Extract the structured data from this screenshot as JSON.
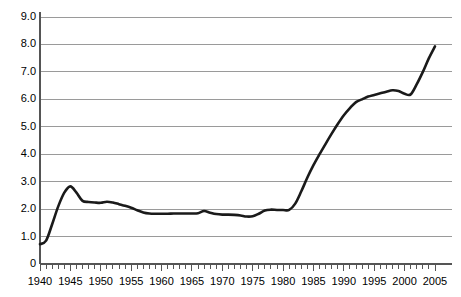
{
  "chart_data": {
    "type": "line",
    "title": "",
    "subtitle": "",
    "xlabel": "",
    "ylabel": "",
    "xlim": [
      1940,
      2005
    ],
    "ylim": [
      0,
      9.0
    ],
    "grid": true,
    "grid_axis": "y",
    "legend": false,
    "legend_position": "none",
    "line_color": "#1a1a1a",
    "line_width": 2.6,
    "grid_color": "#9a9a9a",
    "axis_color": "#555555",
    "background": "#ffffff",
    "x_tick_labels": [
      "1940",
      "1945",
      "1950",
      "1955",
      "1960",
      "1965",
      "1970",
      "1975",
      "1980",
      "1985",
      "1990",
      "1995",
      "2000",
      "2005"
    ],
    "x_tick_values": [
      1940,
      1945,
      1950,
      1955,
      1960,
      1965,
      1970,
      1975,
      1980,
      1985,
      1990,
      1995,
      2000,
      2005
    ],
    "x_minor_tick_step": 1,
    "y_tick_labels": [
      "0",
      "1.0",
      "2.0",
      "3.0",
      "4.0",
      "5.0",
      "6.0",
      "7.0",
      "8.0",
      "9.0"
    ],
    "y_tick_values": [
      0,
      1.0,
      2.0,
      3.0,
      4.0,
      5.0,
      6.0,
      7.0,
      8.0,
      9.0
    ],
    "series": [
      {
        "name": "series-1",
        "x": [
          1940,
          1941,
          1942,
          1943,
          1944,
          1945,
          1946,
          1947,
          1948,
          1949,
          1950,
          1951,
          1952,
          1953,
          1954,
          1955,
          1956,
          1957,
          1958,
          1959,
          1960,
          1961,
          1962,
          1963,
          1964,
          1965,
          1966,
          1967,
          1968,
          1969,
          1970,
          1971,
          1972,
          1973,
          1974,
          1975,
          1976,
          1977,
          1978,
          1979,
          1980,
          1981,
          1982,
          1983,
          1984,
          1985,
          1986,
          1987,
          1988,
          1989,
          1990,
          1991,
          1992,
          1993,
          1994,
          1995,
          1996,
          1997,
          1998,
          1999,
          2000,
          2001,
          2002,
          2003,
          2004,
          2005
        ],
        "y": [
          0.72,
          0.85,
          1.45,
          2.1,
          2.6,
          2.83,
          2.6,
          2.3,
          2.26,
          2.24,
          2.23,
          2.27,
          2.24,
          2.18,
          2.12,
          2.05,
          1.96,
          1.88,
          1.84,
          1.83,
          1.83,
          1.83,
          1.84,
          1.84,
          1.84,
          1.84,
          1.85,
          1.93,
          1.87,
          1.82,
          1.8,
          1.8,
          1.79,
          1.77,
          1.73,
          1.74,
          1.83,
          1.95,
          1.98,
          1.97,
          1.97,
          1.97,
          2.2,
          2.65,
          3.15,
          3.6,
          4.0,
          4.38,
          4.75,
          5.1,
          5.42,
          5.68,
          5.9,
          6.0,
          6.1,
          6.16,
          6.22,
          6.28,
          6.33,
          6.3,
          6.2,
          6.18,
          6.55,
          7.0,
          7.5,
          7.93
        ]
      }
    ]
  },
  "axes": {
    "y_axis_name": "y-axis",
    "x_axis_name": "x-axis"
  }
}
